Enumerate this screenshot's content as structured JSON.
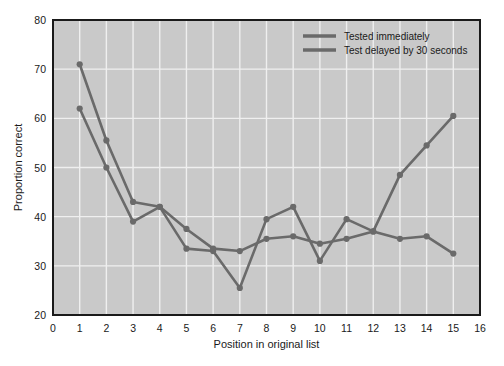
{
  "chart_data": {
    "type": "line",
    "title": "",
    "xlabel": "Position in original list",
    "ylabel": "Proportion correct",
    "xlim": [
      0,
      16
    ],
    "ylim": [
      20,
      80
    ],
    "xticks": [
      "0",
      "1",
      "2",
      "3",
      "4",
      "5",
      "6",
      "7",
      "8",
      "9",
      "10",
      "11",
      "12",
      "13",
      "14",
      "15",
      "16"
    ],
    "yticks": [
      "20",
      "30",
      "40",
      "50",
      "60",
      "70",
      "80"
    ],
    "grid": true,
    "legend_position": "top-right",
    "plot_background": "#c9c9c9",
    "line_color": "#6a6a6a",
    "x": [
      1,
      2,
      3,
      4,
      5,
      6,
      7,
      8,
      9,
      10,
      11,
      12,
      13,
      14,
      15
    ],
    "series": [
      {
        "name": "Tested immediately",
        "values": [
          71,
          55.5,
          43,
          42,
          37.5,
          33.5,
          33,
          35.5,
          36,
          34.5,
          35.5,
          37,
          48.5,
          54.5,
          60.5
        ]
      },
      {
        "name": "Test delayed by 30 seconds",
        "values": [
          62,
          50,
          39,
          42,
          33.5,
          33,
          25.5,
          39.5,
          42,
          31,
          39.5,
          37,
          35.5,
          36,
          32.5
        ]
      }
    ]
  },
  "legend": {
    "items": [
      {
        "label": "Tested immediately"
      },
      {
        "label": "Test delayed by 30 seconds"
      }
    ]
  },
  "axes": {
    "x_title": "Position in original list",
    "y_title": "Proportion correct"
  }
}
